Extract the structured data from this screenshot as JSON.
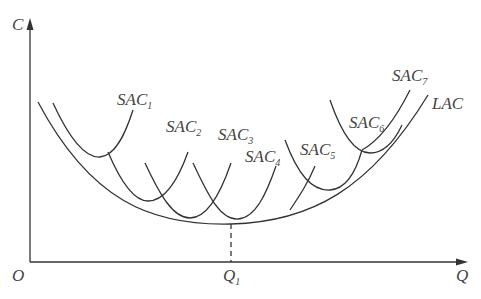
{
  "diagram": {
    "axes": {
      "y_label": "C",
      "x_label": "Q",
      "origin_label": "O",
      "x_tick": {
        "main": "Q",
        "sub": "1"
      }
    },
    "curves": [
      {
        "id": "SAC1",
        "main": "SAC",
        "sub": "1"
      },
      {
        "id": "SAC2",
        "main": "SAC",
        "sub": "2"
      },
      {
        "id": "SAC3",
        "main": "SAC",
        "sub": "3"
      },
      {
        "id": "SAC4",
        "main": "SAC",
        "sub": "4"
      },
      {
        "id": "SAC5",
        "main": "SAC",
        "sub": "5"
      },
      {
        "id": "SAC6",
        "main": "SAC",
        "sub": "6"
      },
      {
        "id": "SAC7",
        "main": "SAC",
        "sub": "7"
      },
      {
        "id": "LAC",
        "main": "LAC",
        "sub": ""
      }
    ],
    "colors": {
      "line": "#333333",
      "text": "#444444",
      "background": "#ffffff"
    }
  }
}
